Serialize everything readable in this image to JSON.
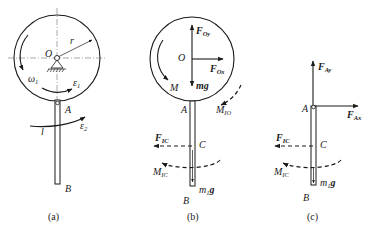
{
  "figure": {
    "panels": [
      {
        "id": "a",
        "caption": "(a)",
        "labels": {
          "center": "O",
          "radius": "r",
          "omega": "ω",
          "omega_sub": "1",
          "eps1": "ε",
          "eps1_sub": "1",
          "eps2": "ε",
          "eps2_sub": "2",
          "length": "l",
          "pointA": "A",
          "pointB": "B"
        }
      },
      {
        "id": "b",
        "caption": "(b)",
        "labels": {
          "center": "O",
          "FOy": "F",
          "FOy_sub": "Oy",
          "FOx": "F",
          "FOx_sub": "Ox",
          "weight": "mg",
          "moment": "M",
          "MIO": "M",
          "MIO_sub": "IO",
          "pointA": "A",
          "pointC": "C",
          "pointB": "B",
          "FIC": "F",
          "FIC_sub": "IC",
          "MIC": "M",
          "MIC_sub": "IC",
          "rod_weight_m": "m",
          "rod_weight_sub": "1",
          "rod_weight_g": "g"
        }
      },
      {
        "id": "c",
        "caption": "(c)",
        "labels": {
          "FAy": "F",
          "FAy_sub": "Ay",
          "FAx": "F",
          "FAx_sub": "Ax",
          "pointA": "A",
          "pointC": "C",
          "pointB": "B",
          "FIC": "F",
          "FIC_sub": "IC",
          "MIC": "M",
          "MIC_sub": "IC",
          "rod_weight_m": "m",
          "rod_weight_sub": "1",
          "rod_weight_g": "g"
        }
      }
    ]
  }
}
